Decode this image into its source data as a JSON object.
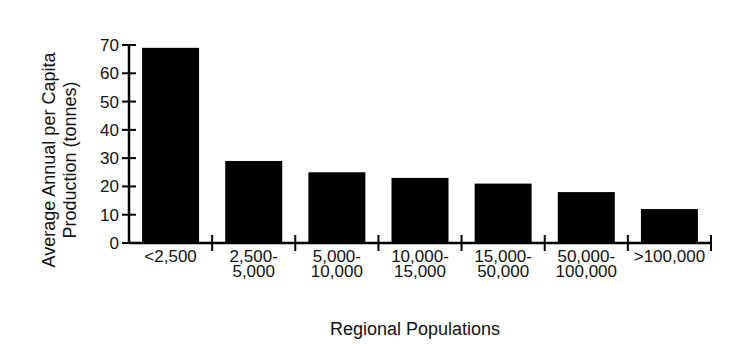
{
  "chart_data": {
    "type": "bar",
    "title": "",
    "xlabel": "Regional Populations",
    "ylabel": [
      "Average Annual per Capita",
      "Production (tonnes)"
    ],
    "categories": [
      [
        "<2,500"
      ],
      [
        "2,500-",
        "5,000"
      ],
      [
        "5,000-",
        "10,000"
      ],
      [
        "10,000-",
        "15,000"
      ],
      [
        "15,000-",
        "50,000"
      ],
      [
        "50,000-",
        "100,000"
      ],
      [
        ">100,000"
      ]
    ],
    "values": [
      69,
      29,
      25,
      23,
      21,
      18,
      12
    ],
    "ylim": [
      0,
      70
    ],
    "yticks": [
      0,
      10,
      20,
      30,
      40,
      50,
      60,
      70
    ],
    "grid": false,
    "legend": null,
    "bar_color": "#000000"
  }
}
